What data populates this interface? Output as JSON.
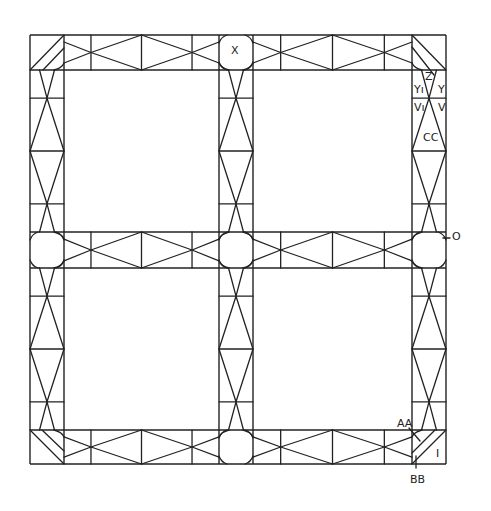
{
  "diagram": {
    "stroke_color": "#222222",
    "background": "#ffffff",
    "grid": {
      "x": [
        30,
        64,
        219,
        253,
        412,
        446
      ],
      "y": [
        35,
        70,
        232,
        268,
        430,
        464
      ]
    },
    "labels": [
      {
        "id": "X",
        "text": "X",
        "x": 231,
        "y": 54
      },
      {
        "id": "Z",
        "text": "Z",
        "x": 425,
        "y": 80
      },
      {
        "id": "Y-left",
        "text": "Yı",
        "x": 414,
        "y": 93
      },
      {
        "id": "Y-right",
        "text": "Y",
        "x": 438,
        "y": 93
      },
      {
        "id": "V-left",
        "text": "Vı",
        "x": 414,
        "y": 111
      },
      {
        "id": "V-right",
        "text": "V",
        "x": 438,
        "y": 111
      },
      {
        "id": "CC",
        "text": "CC",
        "x": 423,
        "y": 141
      },
      {
        "id": "O",
        "text": "O",
        "x": 452,
        "y": 240
      },
      {
        "id": "AA",
        "text": "AA",
        "x": 397,
        "y": 427
      },
      {
        "id": "I",
        "text": "I",
        "x": 436,
        "y": 457
      },
      {
        "id": "BB",
        "text": "BB",
        "x": 410,
        "y": 483
      }
    ]
  }
}
